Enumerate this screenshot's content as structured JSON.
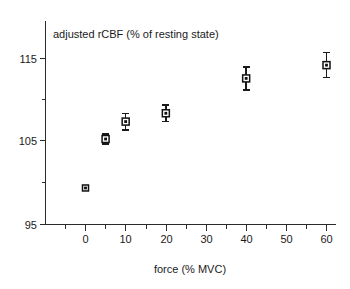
{
  "chart_data": {
    "type": "scatter",
    "title": "adjusted rCBF (% of resting state)",
    "subtitle": "",
    "xlabel": "force (% MVC)",
    "ylabel": "",
    "x": [
      0,
      5,
      10,
      20,
      40,
      60
    ],
    "values": [
      99.4,
      105.3,
      107.4,
      108.4,
      112.6,
      114.2
    ],
    "errors": [
      0.0,
      0.6,
      1.0,
      1.0,
      1.4,
      1.5
    ],
    "series": [
      {
        "name": "adjusted rCBF",
        "x": [
          0,
          5,
          10,
          20,
          40,
          60
        ],
        "values": [
          99.4,
          105.3,
          107.4,
          108.4,
          112.6,
          114.2
        ],
        "errors": [
          0.0,
          0.6,
          1.0,
          1.0,
          1.4,
          1.5
        ]
      }
    ],
    "xlim": [
      -3,
      63
    ],
    "ylim": [
      95,
      118
    ],
    "xticks": [
      0,
      10,
      20,
      30,
      40,
      50,
      60
    ],
    "xtick_labels": [
      "0",
      "10",
      "20",
      "30",
      "40",
      "50",
      "60"
    ],
    "x_minor_ticks": [
      5,
      15,
      25,
      35,
      45,
      55
    ],
    "yticks": [
      95,
      105,
      115
    ],
    "ytick_labels": [
      "95",
      "105",
      "115"
    ],
    "y_minor_ticks": [
      100,
      110
    ],
    "grid": false,
    "legend": "none",
    "marker_style": "open-square-with-dot",
    "error_bar_style": "capped-vertical",
    "colors": {
      "axis": "#2b2b2b",
      "marker_edge": "#111111",
      "marker_fill": "#ffffff",
      "error_bar": "#1a1a1a",
      "text": "#1a1a1a",
      "background": "#ffffff"
    }
  }
}
